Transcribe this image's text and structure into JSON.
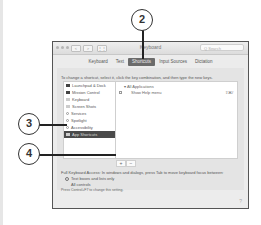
{
  "window": {
    "title": "Keyboard",
    "search_placeholder": "Q Search",
    "nav_back": "<",
    "nav_forward": ">",
    "grid_icon": "grid-icon"
  },
  "tabs": [
    {
      "label": "Keyboard"
    },
    {
      "label": "Text"
    },
    {
      "label": "Shortcuts",
      "active": true
    },
    {
      "label": "Input Sources"
    },
    {
      "label": "Dictation"
    }
  ],
  "instructions": "To change a shortcut, select it, click the key combination, and then type the new keys.",
  "categories": [
    {
      "label": "Launchpad & Dock",
      "icon": "launchpad-icon"
    },
    {
      "label": "Mission Control",
      "icon": "mission-control-icon"
    },
    {
      "label": "Keyboard",
      "icon": "keyboard-icon"
    },
    {
      "label": "Screen Shots",
      "icon": "screenshot-icon"
    },
    {
      "label": "Services",
      "icon": "services-icon"
    },
    {
      "label": "Spotlight",
      "icon": "spotlight-icon"
    },
    {
      "label": "Accessibility",
      "icon": "accessibility-icon"
    },
    {
      "label": "App Shortcuts",
      "icon": "app-shortcuts-icon",
      "selected": true
    }
  ],
  "shortcuts": {
    "group": "▾ All Applications",
    "rows": [
      {
        "label": "Show Help menu",
        "key": "⇧⌘/",
        "checked": true
      }
    ]
  },
  "buttons": {
    "add": "+",
    "remove": "−"
  },
  "full_keyboard_access": "Full Keyboard Access: In windows and dialogs, press Tab to move keyboard focus between:",
  "radio_options": [
    {
      "label": "Text boxes and lists only",
      "selected": true
    },
    {
      "label": "All controls",
      "selected": false
    }
  ],
  "hint": "Press Control+F7 to change this setting.",
  "help": "?",
  "callouts": [
    {
      "number": "2"
    },
    {
      "number": "3"
    },
    {
      "number": "4"
    }
  ]
}
